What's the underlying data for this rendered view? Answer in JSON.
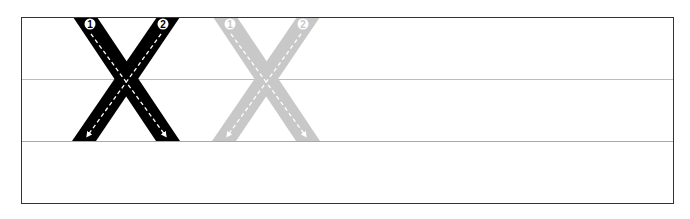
{
  "worksheet": {
    "letter": "X",
    "case": "uppercase",
    "colors": {
      "border": "#333333",
      "guide_line": "#b4b4b4",
      "model_letter": "#000000",
      "trace_letter": "#c8c8c8",
      "arrow": "#ffffff"
    },
    "guide_lines": [
      "top",
      "midline",
      "baseline",
      "bottom"
    ],
    "letters": [
      {
        "style": "model",
        "strokes": [
          {
            "order": "1",
            "label": "stroke-1",
            "direction": "top-left to bottom-right"
          },
          {
            "order": "2",
            "label": "stroke-2",
            "direction": "top-right to bottom-left"
          }
        ]
      },
      {
        "style": "trace",
        "strokes": [
          {
            "order": "1",
            "label": "stroke-1",
            "direction": "top-left to bottom-right"
          },
          {
            "order": "2",
            "label": "stroke-2",
            "direction": "top-right to bottom-left"
          }
        ]
      }
    ],
    "blank_practice_area": "remaining space to the right"
  }
}
